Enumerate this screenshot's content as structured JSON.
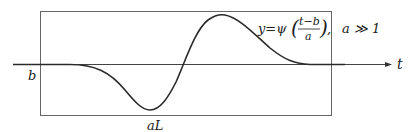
{
  "diagram": {
    "formula_lhs": "y=ψ",
    "frac_num": "t−b",
    "frac_den": "a",
    "formula_tail": ",",
    "condition": "a ≫ 1",
    "axis_label": "t",
    "origin_label": "b",
    "width_label": "aL",
    "colors": {
      "curve": "#2a2a2a",
      "axis": "#333333",
      "box": "#555555"
    }
  }
}
